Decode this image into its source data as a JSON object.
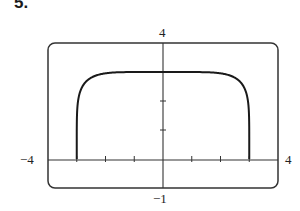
{
  "problem": {
    "number": "5."
  },
  "chart_data": {
    "type": "line",
    "title": "",
    "xlabel": "",
    "ylabel": "",
    "xlim": [
      -4,
      4
    ],
    "ylim": [
      -1,
      4
    ],
    "grid": false,
    "legend": null,
    "window_labels": {
      "xmin": "−4",
      "xmax": "4",
      "ymin": "−1",
      "ymax": "4"
    },
    "x_ticks": [
      -3,
      -2,
      -1,
      1,
      2,
      3
    ],
    "y_ticks": [
      1,
      2,
      3
    ],
    "series": [
      {
        "name": "curve",
        "description": "Flat-topped curve rising vertically from (-3,0), plateau near y=3, descending vertically to (3,0)",
        "x": [
          -3,
          -2.95,
          -2.8,
          -2.5,
          -2,
          -1,
          0,
          1,
          2,
          2.5,
          2.8,
          2.95,
          3
        ],
        "y": [
          0,
          1.6,
          2.3,
          2.7,
          2.93,
          3.0,
          3.0,
          3.0,
          2.93,
          2.7,
          2.3,
          1.6,
          0
        ]
      }
    ],
    "colors": {
      "line": "#1a1a1a",
      "frame": "#333333",
      "axes": "#333333"
    }
  }
}
